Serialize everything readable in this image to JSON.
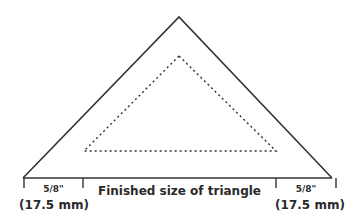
{
  "diagram": {
    "type": "quilt-triangle-template",
    "colors": {
      "line": "#333333",
      "text": "#2a2a2a",
      "background": "#ffffff"
    },
    "outer_triangle": {
      "apex": [
        179,
        17
      ],
      "left": [
        23,
        178
      ],
      "right": [
        332,
        178
      ],
      "style": "solid"
    },
    "inner_triangle": {
      "apex": [
        179,
        56
      ],
      "left": [
        84,
        151
      ],
      "right": [
        276,
        151
      ],
      "style": "dotted",
      "label": "Finished size of triangle"
    },
    "labels": {
      "left_seam_fraction": "5/8\"",
      "left_seam_mm": "(17.5 mm)",
      "center": "Finished size of triangle",
      "right_seam_fraction": "5/8\"",
      "right_seam_mm": "(17.5 mm)"
    }
  }
}
